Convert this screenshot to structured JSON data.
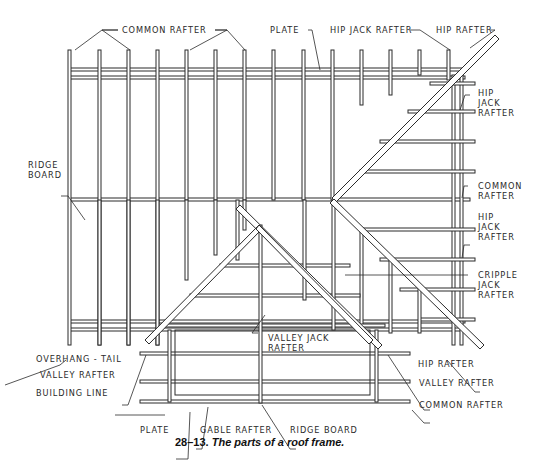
{
  "figure": {
    "number": "28–13.",
    "caption": "The parts of a roof frame."
  },
  "labels": {
    "common_rafter_top": "COMMON RAFTER",
    "plate_top": "PLATE",
    "hip_jack_rafter_top": "HIP JACK RAFTER",
    "hip_rafter_top": "HIP RAFTER",
    "hip_jack_rafter_right_1": "HIP\nJACK\nRAFTER",
    "common_rafter_right": "COMMON\nRAFTER",
    "hip_jack_rafter_right_2": "HIP\nJACK\nRAFTER",
    "cripple_jack_rafter": "CRIPPLE\nJACK\nRAFTER",
    "ridge_board_left": "RIDGE\nBOARD",
    "overhang_tail": "OVERHANG - TAIL",
    "valley_rafter_left": "VALLEY RAFTER",
    "building_line": "BUILDING LINE",
    "plate_bottom": "PLATE",
    "gable_rafter": "GABLE RAFTER",
    "ridge_board_bottom": "RIDGE BOARD",
    "valley_jack_rafter": "VALLEY JACK\nRAFTER",
    "hip_rafter_bottom": "HIP RAFTER",
    "valley_rafter_right": "VALLEY RAFTER",
    "common_rafter_bottom": "COMMON RAFTER"
  },
  "colors": {
    "line": "#2b2b2b",
    "fill": "#ffffff"
  }
}
